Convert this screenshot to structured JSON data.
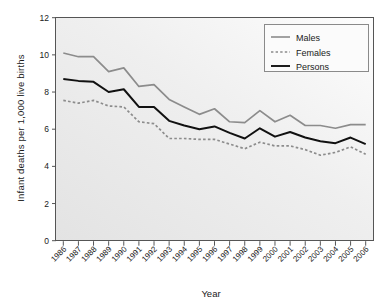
{
  "chart_data": {
    "type": "line",
    "title": "",
    "xlabel": "Year",
    "ylabel": "Infant  deaths per 1,000 live births",
    "xlim": [
      1986,
      2006
    ],
    "ylim": [
      0,
      12
    ],
    "ytick_values": [
      0,
      2,
      4,
      6,
      8,
      10,
      12
    ],
    "ytick_labels": [
      "0",
      "2",
      "4",
      "6",
      "8",
      "10",
      "12"
    ],
    "grid": false,
    "legend_position": "top-right",
    "x": [
      1986,
      1987,
      1988,
      1989,
      1990,
      1991,
      1992,
      1993,
      1994,
      1995,
      1996,
      1997,
      1998,
      1999,
      2000,
      2001,
      2002,
      2003,
      2004,
      2005,
      2006
    ],
    "categories": [
      "1986",
      "1987",
      "1988",
      "1989",
      "1990",
      "1991",
      "1992",
      "1993",
      "1994",
      "1995",
      "1996",
      "1997",
      "1998",
      "1999",
      "2000",
      "2001",
      "2002",
      "2003",
      "2004",
      "2005",
      "2006"
    ],
    "series": [
      {
        "name": "Males",
        "color": "#8c8c8c",
        "style": "solid",
        "values": [
          10.1,
          9.9,
          9.9,
          9.1,
          9.3,
          8.3,
          8.4,
          7.6,
          7.2,
          6.8,
          7.1,
          6.4,
          6.35,
          7.0,
          6.4,
          6.75,
          6.2,
          6.2,
          6.05,
          6.25,
          6.25
        ]
      },
      {
        "name": "Females",
        "color": "#8c8c8c",
        "style": "dotted",
        "values": [
          7.55,
          7.4,
          7.55,
          7.25,
          7.2,
          6.4,
          6.3,
          5.5,
          5.5,
          5.45,
          5.45,
          5.2,
          4.95,
          5.3,
          5.1,
          5.1,
          4.9,
          4.6,
          4.75,
          5.05,
          4.65
        ]
      },
      {
        "name": "Persons",
        "color": "#111111",
        "style": "solid",
        "values": [
          8.7,
          8.6,
          8.55,
          8.0,
          8.15,
          7.2,
          7.2,
          6.45,
          6.2,
          6.0,
          6.15,
          5.8,
          5.5,
          6.05,
          5.6,
          5.85,
          5.55,
          5.35,
          5.25,
          5.55,
          5.2
        ]
      }
    ]
  },
  "legend": {
    "items": [
      {
        "label": "Males"
      },
      {
        "label": "Females"
      },
      {
        "label": "Persons"
      }
    ]
  },
  "axes": {
    "x_title": "Year",
    "y_title": "Infant  deaths per 1,000 live births"
  }
}
